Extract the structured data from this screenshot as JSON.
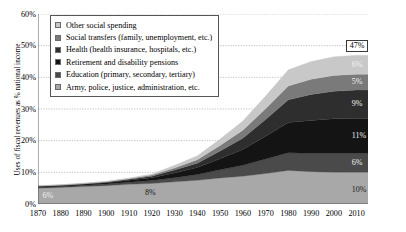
{
  "chart_data": {
    "type": "area",
    "title": "",
    "subtitle": "",
    "xlabel": "",
    "ylabel": "Uses of fiscal revenues as % national income",
    "xlim": [
      1870,
      2015
    ],
    "ylim": [
      0,
      60
    ],
    "grid": true,
    "stacked": true,
    "legend_position": "top-left inside plot",
    "ytick_labels": [
      "0%",
      "10%",
      "20%",
      "30%",
      "40%",
      "50%",
      "60%"
    ],
    "ytick_values": [
      0,
      10,
      20,
      30,
      40,
      50,
      60
    ],
    "xtick_labels": [
      "1870",
      "1880",
      "1890",
      "1900",
      "1910",
      "1920",
      "1930",
      "1940",
      "1950",
      "1960",
      "1970",
      "1980",
      "1990",
      "2000",
      "2010"
    ],
    "xtick_values": [
      1870,
      1880,
      1890,
      1900,
      1910,
      1920,
      1930,
      1940,
      1950,
      1960,
      1970,
      1980,
      1990,
      2000,
      2010
    ],
    "x": [
      1870,
      1880,
      1890,
      1900,
      1910,
      1920,
      1930,
      1940,
      1950,
      1960,
      1970,
      1980,
      1990,
      2000,
      2010,
      2015
    ],
    "series": [
      {
        "name": "Army, police, justice, administration, etc.",
        "color": "#a8a8a8",
        "stack_order": 1,
        "values": [
          5.0,
          5.2,
          5.5,
          5.8,
          6.2,
          6.5,
          7.0,
          7.5,
          8.2,
          8.8,
          9.6,
          10.6,
          10.2,
          10.0,
          10.0,
          10.0
        ]
      },
      {
        "name": "Education (primary, secondary, tertiary)",
        "color": "#4a4a4a",
        "stack_order": 2,
        "values": [
          0.3,
          0.35,
          0.4,
          0.5,
          0.7,
          0.9,
          1.3,
          1.8,
          2.6,
          3.4,
          4.6,
          5.6,
          5.8,
          6.0,
          6.0,
          6.0
        ]
      },
      {
        "name": "Retirement and disability pensions",
        "color": "#141414",
        "stack_order": 3,
        "values": [
          0.2,
          0.25,
          0.3,
          0.4,
          0.6,
          0.9,
          1.5,
          2.2,
          3.5,
          5.0,
          7.2,
          9.5,
          10.4,
          10.9,
          11.0,
          11.0
        ]
      },
      {
        "name": "Health (health insurance, hospitals, etc.)",
        "color": "#2e2e2e",
        "stack_order": 4,
        "values": [
          0.1,
          0.12,
          0.15,
          0.2,
          0.3,
          0.5,
          0.9,
          1.4,
          2.4,
          3.6,
          5.3,
          7.2,
          8.2,
          8.7,
          9.0,
          9.0
        ]
      },
      {
        "name": "Social transfers (family, unemployment, etc.)",
        "color": "#7a7a7a",
        "stack_order": 5,
        "values": [
          0.1,
          0.1,
          0.12,
          0.15,
          0.2,
          0.35,
          0.7,
          1.1,
          1.8,
          2.5,
          3.4,
          4.4,
          4.8,
          5.0,
          5.0,
          5.0
        ]
      },
      {
        "name": "Other social spending",
        "color": "#c8c8c8",
        "stack_order": 6,
        "values": [
          0.1,
          0.1,
          0.12,
          0.15,
          0.2,
          0.35,
          0.8,
          1.2,
          2.0,
          2.9,
          4.0,
          5.1,
          5.6,
          5.9,
          6.0,
          6.0
        ]
      }
    ],
    "totals": [
      5.8,
      6.1,
      6.6,
      7.2,
      8.2,
      9.5,
      12.2,
      15.2,
      20.5,
      26.2,
      34.1,
      42.4,
      45.0,
      46.5,
      47.0,
      47.0
    ],
    "annotations": [
      {
        "text": "6%",
        "x": 1872,
        "y": 2.5,
        "style": "light",
        "note": "total circa 1870"
      },
      {
        "text": "8%",
        "x": 1917,
        "y": 3.5,
        "style": "dark",
        "note": "total circa 1910-1920"
      },
      {
        "text": "47%",
        "x": 2014,
        "y": 49.5,
        "style": "boxed",
        "note": "total circa 2010"
      },
      {
        "text": "6%",
        "x": 2014,
        "y": 44.0,
        "style": "light",
        "note": "Other social spending share"
      },
      {
        "text": "5%",
        "x": 2014,
        "y": 38.5,
        "style": "light",
        "note": "Social transfers share"
      },
      {
        "text": "9%",
        "x": 2014,
        "y": 31.5,
        "style": "light",
        "note": "Health share"
      },
      {
        "text": "11%",
        "x": 2014,
        "y": 21.5,
        "style": "light",
        "note": "Retirement and disability pensions share"
      },
      {
        "text": "6%",
        "x": 2014,
        "y": 13.0,
        "style": "light",
        "note": "Education share"
      },
      {
        "text": "10%",
        "x": 2014,
        "y": 4.5,
        "style": "dark",
        "note": "Army, police, justice, administration share"
      }
    ]
  },
  "legend": {
    "items": [
      {
        "label": "Other social spending",
        "color": "#c8c8c8"
      },
      {
        "label": "Social transfers (family, unemployment, etc.)",
        "color": "#7a7a7a"
      },
      {
        "label": "Health (health insurance, hospitals, etc.)",
        "color": "#2e2e2e"
      },
      {
        "label": "Retirement and disability pensions",
        "color": "#141414"
      },
      {
        "label": "Education (primary, secondary, tertiary)",
        "color": "#4a4a4a"
      },
      {
        "label": "Army, police, justice, administration, etc.",
        "color": "#a8a8a8"
      }
    ]
  },
  "axis": {
    "y_title": "Uses of fiscal revenues as % national income"
  }
}
